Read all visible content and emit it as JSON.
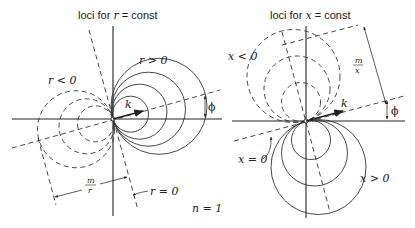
{
  "figure": {
    "left_panel": {
      "title_prefix": "loci for ",
      "title_var": "r",
      "title_suffix": " = const",
      "region_positive": "r > 0",
      "region_negative": "r < 0",
      "vector_label": "k",
      "angle_label": "ϕ",
      "distance_label_num": "m",
      "distance_label_den": "r",
      "zero_line_label": "r = 0",
      "parameter_label": "n = 1"
    },
    "right_panel": {
      "title_prefix": "loci for ",
      "title_var": "x",
      "title_suffix": " = const",
      "region_positive": "x > 0",
      "region_negative": "x < 0",
      "vector_label": "k",
      "angle_label": "ϕ",
      "distance_label_num": "m",
      "distance_label_den": "x",
      "zero_line_label": "x = 0"
    }
  }
}
